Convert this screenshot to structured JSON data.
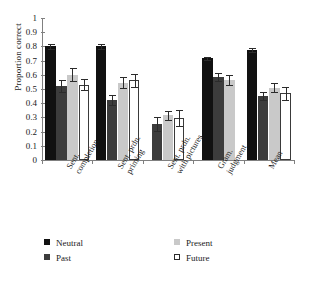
{
  "chart_data": {
    "type": "bar",
    "title": "",
    "xlabel": "",
    "ylabel": "Proportion correct",
    "ylim": [
      0,
      1
    ],
    "ytick_labels": [
      "0",
      "0.1",
      "0.2",
      "0.3",
      "0.4",
      "0.5",
      "0.6",
      "0.7",
      "0.8",
      "0.9",
      "1"
    ],
    "ytick_values": [
      0,
      0.1,
      0.2,
      0.3,
      0.4,
      0.5,
      0.6,
      0.7,
      0.8,
      0.9,
      1
    ],
    "grid": false,
    "legend_position": "bottom",
    "categories": [
      "Sent. completion",
      "Sent. prdn. priming",
      "Sent. prdn. with pictures",
      "Gram. judgment",
      "Mean"
    ],
    "category_lines": [
      [
        "Sent.",
        "completion"
      ],
      [
        "Sent. prdn.",
        "priming"
      ],
      [
        "Sent. prdn.",
        "with pictures"
      ],
      [
        "Gram.",
        "judgment"
      ],
      [
        "Mean"
      ]
    ],
    "series": [
      {
        "name": "Neutral",
        "color": "#111111",
        "values": [
          0.8,
          0.8,
          null,
          0.715,
          0.775
        ],
        "errors": [
          0.017,
          0.018,
          null,
          0.013,
          0.015
        ]
      },
      {
        "name": "Past",
        "color": "#3c3c3c",
        "values": [
          0.52,
          0.42,
          0.255,
          0.585,
          0.45
        ],
        "errors": [
          0.043,
          0.035,
          0.048,
          0.03,
          0.028
        ]
      },
      {
        "name": "Present",
        "color": "#c9c9c9",
        "values": [
          0.6,
          0.545,
          0.315,
          0.565,
          0.51
        ],
        "errors": [
          0.047,
          0.04,
          0.03,
          0.035,
          0.033
        ]
      },
      {
        "name": "Future",
        "color": "#ffffff",
        "values": [
          0.53,
          0.56,
          0.295,
          null,
          0.47
        ],
        "errors": [
          0.04,
          0.046,
          0.055,
          null,
          0.045
        ]
      }
    ]
  },
  "legend": {
    "items": [
      {
        "label": "Neutral",
        "swatch": "neutral"
      },
      {
        "label": "Past",
        "swatch": "past"
      },
      {
        "label": "Present",
        "swatch": "present"
      },
      {
        "label": "Future",
        "swatch": "future"
      }
    ]
  }
}
